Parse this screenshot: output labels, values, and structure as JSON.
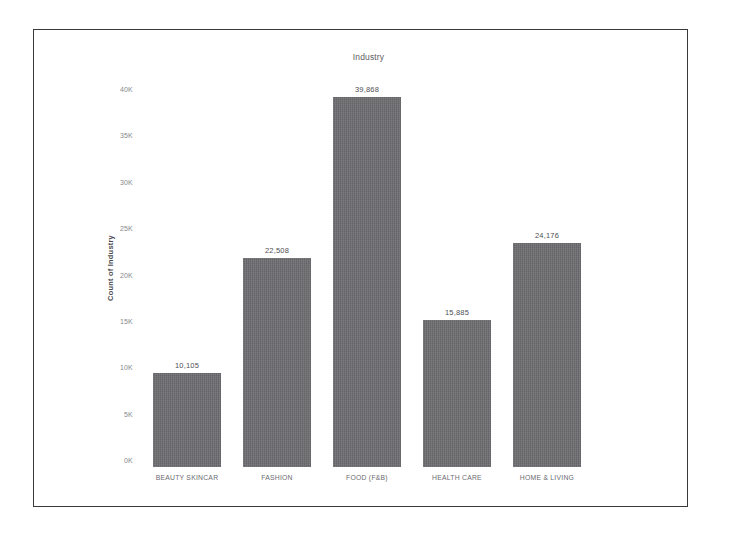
{
  "chart_data": {
    "type": "bar",
    "title": "Industry",
    "xlabel": "",
    "ylabel": "Count of Industry",
    "categories": [
      "BEAUTY SKINCAR",
      "FASHION",
      "FOOD (F&B)",
      "HEALTH CARE",
      "HOME & LIVING"
    ],
    "values": [
      10105,
      22508,
      39868,
      15885,
      24176
    ],
    "value_labels": [
      "10,105",
      "22,508",
      "39,868",
      "15,885",
      "24,176"
    ],
    "ylim": [
      0,
      40000
    ],
    "yticks": [
      0,
      5000,
      10000,
      15000,
      20000,
      25000,
      30000,
      35000,
      40000
    ],
    "ytick_labels": [
      "0K",
      "5K",
      "10K",
      "15K",
      "20K",
      "25K",
      "30K",
      "35K",
      "40K"
    ],
    "grid": false,
    "legend": false,
    "bar_color": "#6e6e72",
    "frame_color": "#3a3a3d",
    "background": "#ffffff"
  }
}
